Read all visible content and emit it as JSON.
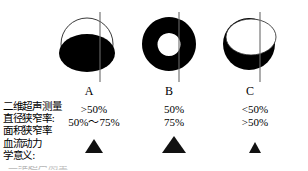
{
  "figures": [
    {
      "id": "A",
      "letter": "A",
      "pattern": "eccentric-plaque",
      "description": "circle outline with black filled lower ellipse (eccentric stenosis)",
      "outline_color": "#000000",
      "fill_color": "#000000",
      "axis_color": "#6a6a6a",
      "diameter_stenosis": ">50%",
      "area_stenosis": "50%～75%",
      "severity_marker": "triangle-medium"
    },
    {
      "id": "B",
      "letter": "B",
      "pattern": "concentric-plaque",
      "description": "black annulus (donut) with white central lumen (concentric stenosis)",
      "outline_color": "#000000",
      "fill_color": "#000000",
      "axis_color": "#6a6a6a",
      "diameter_stenosis": "50%",
      "area_stenosis": "75%",
      "severity_marker": "triangle-large"
    },
    {
      "id": "C",
      "letter": "C",
      "pattern": "crescent-plaque",
      "description": "black disc with large white upper ellipse forming a crescent",
      "outline_color": "#000000",
      "fill_color": "#000000",
      "axis_color": "#6a6a6a",
      "diameter_stenosis": "<50%",
      "area_stenosis": ">50%",
      "severity_marker": "triangle-small"
    }
  ],
  "row_labels": {
    "lines": [
      "二维超声测量",
      "直径狭窄率:",
      "面积狭窄率",
      "血流动力",
      "学意义:"
    ]
  },
  "values": {
    "A": {
      "diameter": ">50%",
      "area": "50%～75%"
    },
    "B": {
      "diameter": "50%",
      "area": "75%"
    },
    "C": {
      "diameter": "<50%",
      "area": ">50%"
    }
  },
  "markers": {
    "A": {
      "name": "triangle-medium",
      "width": 18,
      "height": 14,
      "color": "#111111"
    },
    "B": {
      "name": "triangle-large",
      "width": 24,
      "height": 17,
      "color": "#111111"
    },
    "C": {
      "name": "triangle-small",
      "width": 13,
      "height": 11,
      "color": "#111111"
    }
  },
  "caption": {
    "text": "二维超声测量"
  }
}
